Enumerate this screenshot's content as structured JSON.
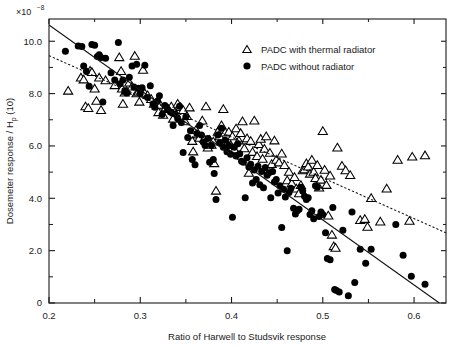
{
  "chart_data": {
    "type": "scatter",
    "title": "",
    "xlabel": "Ratio of Harwell to Studsvik response",
    "ylabel": "Dosemeter response / H",
    "ylabel_sub": "p",
    "ylabel_tail": " (10)",
    "y_exponent_mantissa": "×10",
    "y_exponent_power": "−8",
    "xlim": [
      0.2,
      0.635
    ],
    "ylim": [
      0,
      10.85
    ],
    "xticks": [
      0.2,
      0.3,
      0.4,
      0.5,
      0.6
    ],
    "xtick_labels": [
      "0.2",
      "0.3",
      "0.4",
      "0.5",
      "0.6"
    ],
    "xticks_minor": [
      0.25,
      0.35,
      0.45,
      0.55
    ],
    "yticks": [
      0,
      2,
      4,
      6,
      8,
      10
    ],
    "ytick_labels": [
      "0",
      "2.0",
      "4.0",
      "6.0",
      "8.0",
      "10.0"
    ],
    "yticks_minor": [
      1,
      3,
      5,
      7,
      9
    ],
    "grid": false,
    "legend_position": "top-right",
    "series": [
      {
        "name": "PADC with thermal radiator",
        "marker": "open-triangle",
        "fit_line": "dotted",
        "fit": {
          "x0": 0.2,
          "y0": 9.45,
          "x1": 0.635,
          "y1": 2.68
        },
        "points": [
          [
            0.221,
            8.12
          ],
          [
            0.235,
            8.62
          ],
          [
            0.238,
            8.55
          ],
          [
            0.24,
            7.52
          ],
          [
            0.243,
            7.46
          ],
          [
            0.245,
            8.88
          ],
          [
            0.247,
            8.83
          ],
          [
            0.25,
            8.2
          ],
          [
            0.252,
            7.73
          ],
          [
            0.255,
            8.62
          ],
          [
            0.257,
            7.38
          ],
          [
            0.262,
            8.52
          ],
          [
            0.272,
            8.33
          ],
          [
            0.277,
            9.4
          ],
          [
            0.279,
            8.87
          ],
          [
            0.28,
            8.2
          ],
          [
            0.281,
            7.62
          ],
          [
            0.283,
            8.05
          ],
          [
            0.285,
            8.12
          ],
          [
            0.288,
            8.43
          ],
          [
            0.291,
            8.28
          ],
          [
            0.294,
            9.45
          ],
          [
            0.296,
            8.02
          ],
          [
            0.298,
            8.08
          ],
          [
            0.299,
            7.7
          ],
          [
            0.301,
            8.12
          ],
          [
            0.303,
            8.92
          ],
          [
            0.305,
            8.02
          ],
          [
            0.308,
            7.95
          ],
          [
            0.312,
            7.8
          ],
          [
            0.315,
            7.62
          ],
          [
            0.318,
            7.55
          ],
          [
            0.32,
            7.3
          ],
          [
            0.322,
            7.58
          ],
          [
            0.325,
            7.2
          ],
          [
            0.328,
            7.48
          ],
          [
            0.331,
            7.42
          ],
          [
            0.334,
            7.52
          ],
          [
            0.336,
            7.05
          ],
          [
            0.338,
            7.3
          ],
          [
            0.341,
            7.62
          ],
          [
            0.344,
            7.5
          ],
          [
            0.347,
            7.38
          ],
          [
            0.349,
            6.95
          ],
          [
            0.351,
            7.15
          ],
          [
            0.354,
            7.48
          ],
          [
            0.357,
            6.2
          ],
          [
            0.358,
            5.8
          ],
          [
            0.361,
            6.62
          ],
          [
            0.363,
            6.45
          ],
          [
            0.365,
            6.32
          ],
          [
            0.368,
            6.98
          ],
          [
            0.37,
            6.28
          ],
          [
            0.372,
            7.52
          ],
          [
            0.374,
            5.95
          ],
          [
            0.376,
            6.25
          ],
          [
            0.378,
            6.05
          ],
          [
            0.38,
            6.18
          ],
          [
            0.381,
            5.35
          ],
          [
            0.383,
            4.3
          ],
          [
            0.385,
            6.55
          ],
          [
            0.387,
            6.38
          ],
          [
            0.389,
            6.8
          ],
          [
            0.391,
            7.42
          ],
          [
            0.393,
            6.52
          ],
          [
            0.395,
            6.12
          ],
          [
            0.397,
            6.55
          ],
          [
            0.399,
            6.05
          ],
          [
            0.401,
            6.38
          ],
          [
            0.403,
            5.88
          ],
          [
            0.405,
            6.68
          ],
          [
            0.408,
            6.22
          ],
          [
            0.41,
            6.5
          ],
          [
            0.412,
            6.95
          ],
          [
            0.414,
            5.92
          ],
          [
            0.417,
            6.3
          ],
          [
            0.419,
            4.98
          ],
          [
            0.421,
            6.2
          ],
          [
            0.423,
            5.78
          ],
          [
            0.425,
            6.98
          ],
          [
            0.428,
            5.62
          ],
          [
            0.43,
            6.08
          ],
          [
            0.432,
            6.28
          ],
          [
            0.434,
            5.52
          ],
          [
            0.436,
            5.9
          ],
          [
            0.438,
            6.38
          ],
          [
            0.44,
            5.1
          ],
          [
            0.442,
            5.75
          ],
          [
            0.444,
            5.32
          ],
          [
            0.447,
            6.22
          ],
          [
            0.449,
            5.48
          ],
          [
            0.452,
            5.38
          ],
          [
            0.455,
            5.72
          ],
          [
            0.458,
            5.28
          ],
          [
            0.461,
            4.7
          ],
          [
            0.463,
            5.02
          ],
          [
            0.466,
            4.58
          ],
          [
            0.469,
            4.82
          ],
          [
            0.471,
            4.38
          ],
          [
            0.474,
            4.2
          ],
          [
            0.476,
            4.52
          ],
          [
            0.478,
            5.08
          ],
          [
            0.48,
            5.12
          ],
          [
            0.482,
            5.35
          ],
          [
            0.484,
            5.22
          ],
          [
            0.486,
            4.95
          ],
          [
            0.488,
            5.48
          ],
          [
            0.49,
            5.02
          ],
          [
            0.492,
            4.78
          ],
          [
            0.494,
            5.28
          ],
          [
            0.496,
            4.42
          ],
          [
            0.498,
            4.72
          ],
          [
            0.5,
            6.58
          ],
          [
            0.502,
            5.1
          ],
          [
            0.504,
            4.52
          ],
          [
            0.506,
            3.35
          ],
          [
            0.508,
            4.88
          ],
          [
            0.51,
            2.62
          ],
          [
            0.512,
            2.18
          ],
          [
            0.514,
            2.12
          ],
          [
            0.516,
            5.95
          ],
          [
            0.521,
            5.25
          ],
          [
            0.525,
            5.08
          ],
          [
            0.53,
            4.9
          ],
          [
            0.541,
            3.18
          ],
          [
            0.546,
            3.22
          ],
          [
            0.549,
            2.92
          ],
          [
            0.553,
            4.02
          ],
          [
            0.563,
            3.12
          ],
          [
            0.57,
            4.38
          ],
          [
            0.582,
            5.48
          ],
          [
            0.595,
            3.15
          ],
          [
            0.598,
            5.6
          ],
          [
            0.612,
            5.65
          ]
        ]
      },
      {
        "name": "PADC without radiator",
        "marker": "filled-circle",
        "fit_line": "solid",
        "fit": {
          "x0": 0.2,
          "y0": 10.62,
          "x1": 0.635,
          "y1": -0.18
        },
        "points": [
          [
            0.218,
            9.62
          ],
          [
            0.232,
            9.82
          ],
          [
            0.236,
            9.8
          ],
          [
            0.238,
            9.05
          ],
          [
            0.241,
            8.85
          ],
          [
            0.244,
            8.28
          ],
          [
            0.247,
            9.88
          ],
          [
            0.25,
            9.85
          ],
          [
            0.253,
            9.42
          ],
          [
            0.255,
            9.48
          ],
          [
            0.257,
            9.38
          ],
          [
            0.259,
            7.68
          ],
          [
            0.262,
            9.35
          ],
          [
            0.268,
            8.8
          ],
          [
            0.272,
            8.52
          ],
          [
            0.276,
            9.95
          ],
          [
            0.278,
            8.38
          ],
          [
            0.281,
            8.52
          ],
          [
            0.283,
            8.1
          ],
          [
            0.285,
            8.02
          ],
          [
            0.288,
            8.62
          ],
          [
            0.291,
            9.05
          ],
          [
            0.293,
            8.25
          ],
          [
            0.296,
            9.12
          ],
          [
            0.298,
            8.2
          ],
          [
            0.3,
            8.0
          ],
          [
            0.302,
            8.22
          ],
          [
            0.305,
            9.08
          ],
          [
            0.308,
            7.85
          ],
          [
            0.311,
            8.3
          ],
          [
            0.314,
            7.6
          ],
          [
            0.316,
            7.48
          ],
          [
            0.319,
            7.72
          ],
          [
            0.321,
            7.92
          ],
          [
            0.324,
            7.2
          ],
          [
            0.327,
            7.55
          ],
          [
            0.33,
            7.4
          ],
          [
            0.333,
            7.3
          ],
          [
            0.336,
            6.78
          ],
          [
            0.338,
            7.22
          ],
          [
            0.341,
            7.05
          ],
          [
            0.343,
            7.52
          ],
          [
            0.345,
            6.9
          ],
          [
            0.347,
            5.75
          ],
          [
            0.35,
            7.12
          ],
          [
            0.352,
            6.32
          ],
          [
            0.355,
            6.58
          ],
          [
            0.357,
            5.48
          ],
          [
            0.36,
            5.28
          ],
          [
            0.362,
            6.48
          ],
          [
            0.365,
            6.78
          ],
          [
            0.367,
            6.42
          ],
          [
            0.369,
            6.15
          ],
          [
            0.371,
            6.02
          ],
          [
            0.374,
            6.28
          ],
          [
            0.376,
            5.38
          ],
          [
            0.378,
            6.02
          ],
          [
            0.38,
            5.48
          ],
          [
            0.381,
            4.95
          ],
          [
            0.383,
            3.95
          ],
          [
            0.385,
            6.42
          ],
          [
            0.387,
            6.12
          ],
          [
            0.389,
            6.68
          ],
          [
            0.391,
            5.95
          ],
          [
            0.393,
            6.22
          ],
          [
            0.395,
            5.78
          ],
          [
            0.397,
            6.02
          ],
          [
            0.399,
            5.68
          ],
          [
            0.401,
            3.28
          ],
          [
            0.403,
            5.95
          ],
          [
            0.405,
            5.62
          ],
          [
            0.407,
            6.08
          ],
          [
            0.409,
            5.7
          ],
          [
            0.411,
            5.42
          ],
          [
            0.413,
            5.38
          ],
          [
            0.415,
            4.02
          ],
          [
            0.417,
            5.55
          ],
          [
            0.419,
            5.2
          ],
          [
            0.421,
            5.3
          ],
          [
            0.423,
            4.58
          ],
          [
            0.425,
            5.08
          ],
          [
            0.427,
            4.72
          ],
          [
            0.429,
            5.22
          ],
          [
            0.431,
            4.52
          ],
          [
            0.433,
            5.02
          ],
          [
            0.435,
            4.4
          ],
          [
            0.437,
            5.18
          ],
          [
            0.439,
            4.88
          ],
          [
            0.441,
            4.98
          ],
          [
            0.443,
            4.02
          ],
          [
            0.445,
            5.02
          ],
          [
            0.447,
            4.62
          ],
          [
            0.449,
            4.72
          ],
          [
            0.451,
            4.2
          ],
          [
            0.453,
            4.48
          ],
          [
            0.455,
            2.88
          ],
          [
            0.457,
            4.35
          ],
          [
            0.459,
            4.05
          ],
          [
            0.461,
            2.0
          ],
          [
            0.463,
            4.22
          ],
          [
            0.465,
            4.38
          ],
          [
            0.468,
            3.62
          ],
          [
            0.47,
            3.4
          ],
          [
            0.472,
            3.52
          ],
          [
            0.474,
            3.58
          ],
          [
            0.476,
            4.42
          ],
          [
            0.478,
            4.28
          ],
          [
            0.48,
            4.08
          ],
          [
            0.482,
            3.95
          ],
          [
            0.484,
            4.02
          ],
          [
            0.486,
            3.38
          ],
          [
            0.488,
            3.52
          ],
          [
            0.49,
            3.22
          ],
          [
            0.492,
            4.48
          ],
          [
            0.494,
            4.42
          ],
          [
            0.496,
            3.3
          ],
          [
            0.498,
            3.48
          ],
          [
            0.5,
            3.38
          ],
          [
            0.503,
            2.68
          ],
          [
            0.505,
            1.7
          ],
          [
            0.508,
            1.65
          ],
          [
            0.511,
            3.65
          ],
          [
            0.513,
            0.52
          ],
          [
            0.515,
            0.48
          ],
          [
            0.518,
            0.42
          ],
          [
            0.522,
            2.78
          ],
          [
            0.528,
            0.28
          ],
          [
            0.532,
            3.48
          ],
          [
            0.535,
            0.78
          ],
          [
            0.541,
            2.05
          ],
          [
            0.547,
            1.52
          ],
          [
            0.553,
            2.05
          ],
          [
            0.58,
            3.0
          ],
          [
            0.588,
            1.82
          ],
          [
            0.597,
            1.02
          ],
          [
            0.612,
            0.72
          ]
        ]
      }
    ]
  },
  "legend": {
    "items": [
      {
        "label": "PADC with thermal radiator",
        "marker": "open-triangle"
      },
      {
        "label": "PADC without radiator",
        "marker": "filled-circle"
      }
    ]
  }
}
